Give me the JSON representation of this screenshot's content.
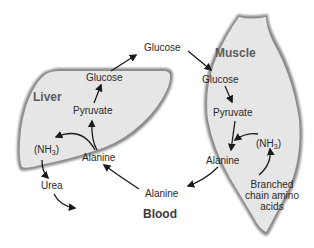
{
  "colors": {
    "organ_fill": "#e6e6e6",
    "organ_edge": "#8a8a8a",
    "text": "#2a2a2a",
    "organ_label": "#5c5c5c",
    "arrow": "#1a1a1a"
  },
  "liver": {
    "label": "Liver",
    "glucose": "Glucose",
    "pyruvate": "Pyruvate",
    "alanine": "Alanine",
    "nh3_prefix": "(NH",
    "nh3_sub": "3",
    "nh3_suffix": ")",
    "urea": "Urea"
  },
  "muscle": {
    "label": "Muscle",
    "glucose": "Glucose",
    "pyruvate": "Pyruvate",
    "alanine": "Alanine",
    "nh3_prefix": "(NH",
    "nh3_sub": "3",
    "nh3_suffix": ")",
    "bcaa_line1": "Branched",
    "bcaa_line2": "chain amino",
    "bcaa_line3": "acids"
  },
  "blood": {
    "label": "Blood",
    "glucose": "Glucose",
    "alanine": "Alanine"
  },
  "flows": [
    {
      "from": "liver.pyruvate",
      "to": "liver.glucose"
    },
    {
      "from": "liver.glucose",
      "to": "blood.glucose"
    },
    {
      "from": "blood.glucose",
      "to": "muscle.glucose"
    },
    {
      "from": "muscle.glucose",
      "to": "muscle.pyruvate"
    },
    {
      "from": "muscle.pyruvate",
      "to": "muscle.alanine"
    },
    {
      "from": "muscle.bcaa",
      "to": "muscle.nh3"
    },
    {
      "from": "muscle.nh3",
      "to": "muscle.alanine"
    },
    {
      "from": "muscle.alanine",
      "to": "blood.alanine"
    },
    {
      "from": "blood.alanine",
      "to": "liver.alanine"
    },
    {
      "from": "liver.alanine",
      "to": "liver.pyruvate"
    },
    {
      "from": "liver.alanine",
      "to": "liver.nh3"
    },
    {
      "from": "liver.nh3",
      "to": "liver.urea"
    },
    {
      "from": "liver.urea",
      "to": "excretion"
    }
  ]
}
